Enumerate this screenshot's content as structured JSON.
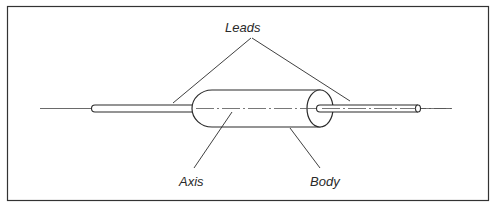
{
  "diagram": {
    "labels": {
      "leads": "Leads",
      "axis": "Axis",
      "body": "Body"
    },
    "colors": {
      "stroke": "#2a2a2a",
      "frame": "#333333",
      "background": "#ffffff"
    }
  }
}
